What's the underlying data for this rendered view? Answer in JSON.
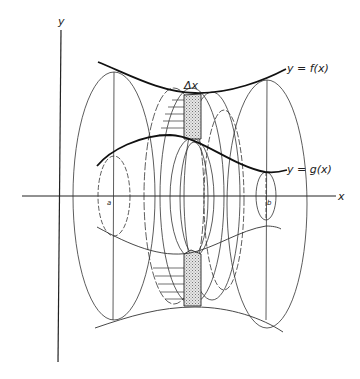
{
  "figure": {
    "type": "washer-method volume of revolution diagram",
    "axes": {
      "x_label": "x",
      "y_label": "y"
    },
    "curves": {
      "upper": {
        "label": "y = f(x)"
      },
      "lower": {
        "label": "y = g(x)"
      }
    },
    "interval": {
      "left_label": "a",
      "right_label": "b"
    },
    "strip": {
      "label": "Δx"
    },
    "colors": {
      "ink": "#222222",
      "shade": "#c8c8c8",
      "background": "#ffffff"
    }
  }
}
